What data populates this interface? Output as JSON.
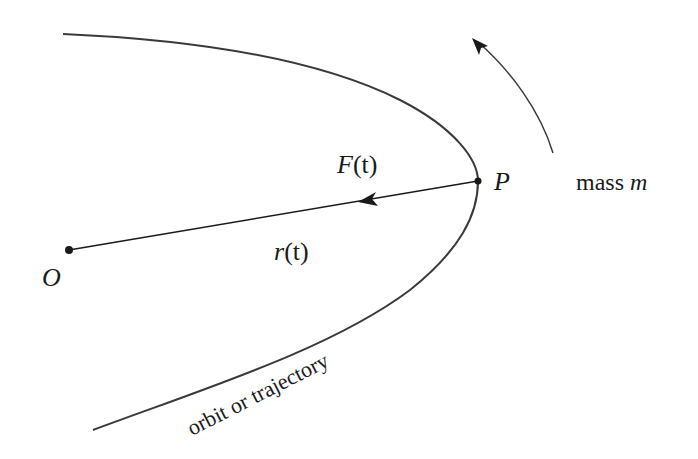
{
  "diagram": {
    "labels": {
      "origin": "O",
      "point": "P",
      "force": "F(t)",
      "force_symbol": "F",
      "force_arg": "(t)",
      "radius": "r(t)",
      "radius_symbol": "r",
      "radius_arg": "(t)",
      "mass_prefix": "mass ",
      "mass_symbol": "m",
      "curve": "orbit or trajectory"
    },
    "colors": {
      "stroke": "#2a2a2a",
      "text": "#1a1a1a",
      "background": "#ffffff"
    }
  }
}
